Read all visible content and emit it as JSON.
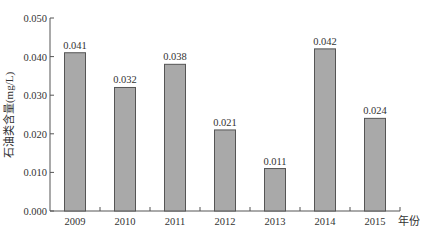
{
  "chart_data": {
    "type": "bar",
    "title": "",
    "xlabel": "年份",
    "ylabel": "石油类含量(mg/L)",
    "categories": [
      "2009",
      "2010",
      "2011",
      "2012",
      "2013",
      "2014",
      "2015"
    ],
    "values": [
      0.041,
      0.032,
      0.038,
      0.021,
      0.011,
      0.042,
      0.024
    ],
    "data_labels": [
      "0.041",
      "0.032",
      "0.038",
      "0.021",
      "0.011",
      "0.042",
      "0.024"
    ],
    "ylim": [
      0,
      0.05
    ],
    "yticks": [
      "0.000",
      "0.010",
      "0.020",
      "0.030",
      "0.040",
      "0.050"
    ],
    "grid": false,
    "legend": null,
    "colors": {
      "bar_fill": "#a9a9a9",
      "bar_stroke": "#555555",
      "axis": "#555555"
    }
  }
}
